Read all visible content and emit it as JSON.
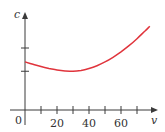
{
  "chart_data": {
    "type": "line",
    "title": "",
    "xlabel": "v",
    "ylabel": "c",
    "origin_label": "0",
    "x_ticks": [
      10,
      20,
      30,
      40,
      50,
      60,
      70
    ],
    "x_tick_labels": [
      {
        "value": 20,
        "label": "20"
      },
      {
        "value": 40,
        "label": "40"
      },
      {
        "value": 60,
        "label": "60"
      }
    ],
    "y_ticks_unlabeled": 2,
    "xlim": [
      0,
      80
    ],
    "ylim": [
      0,
      6
    ],
    "y_tick_values": [
      2.5,
      4
    ],
    "grid": false,
    "legend": "none",
    "series": [
      {
        "name": "c(v)",
        "color": "#e0343c",
        "x": [
          0,
          5,
          10,
          15,
          20,
          25,
          30,
          35,
          40,
          45,
          50,
          55,
          60,
          65,
          70,
          75,
          78
        ],
        "y": [
          3.1,
          2.95,
          2.8,
          2.68,
          2.58,
          2.52,
          2.5,
          2.55,
          2.68,
          2.86,
          3.1,
          3.4,
          3.75,
          4.15,
          4.6,
          5.1,
          5.4
        ]
      }
    ]
  }
}
